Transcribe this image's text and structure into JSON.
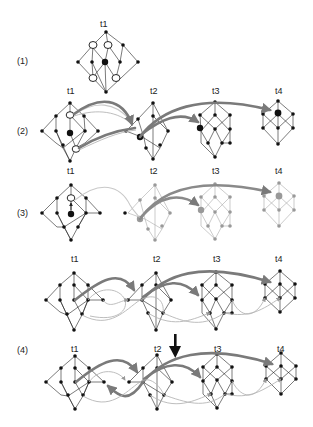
{
  "figure": {
    "panels": [
      {
        "id": "p1",
        "label": "(1)",
        "time_labels": [
          "t1"
        ]
      },
      {
        "id": "p2",
        "label": "(2)",
        "time_labels": [
          "t1",
          "t2",
          "t3",
          "t4"
        ]
      },
      {
        "id": "p3",
        "label": "(3)",
        "time_labels": [
          "t1",
          "t2",
          "t3",
          "t4"
        ]
      },
      {
        "id": "p4a",
        "label": "",
        "time_labels": [
          "t1",
          "t2",
          "t3",
          "t4"
        ]
      },
      {
        "id": "p4b",
        "label": "(4)",
        "time_labels": [
          "t1",
          "t2",
          "t3",
          "t4"
        ]
      }
    ],
    "icons": {
      "down_arrow": "down-arrow-icon"
    },
    "colors": {
      "node": "#111111",
      "faded_node": "#999999",
      "thick_arrow": "#7a7a7a",
      "thin_arrow": "#b5b5b5"
    }
  }
}
